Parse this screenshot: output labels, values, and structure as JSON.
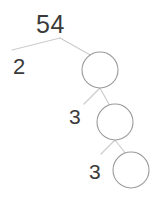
{
  "diagram": {
    "type": "factor-tree",
    "title_value": "54",
    "stroke_color": "#cccccc",
    "circle_stroke_color": "#9a9a9a",
    "text_color": "#3a3a3a",
    "background_color": "#ffffff",
    "labels": {
      "root": "54",
      "factor_2": "2",
      "factor_3a": "3",
      "factor_3b": "3"
    },
    "circles": [
      {
        "name": "circle-level-1",
        "cx": 100,
        "cy": 70,
        "r": 18,
        "value": ""
      },
      {
        "name": "circle-level-2",
        "cx": 115,
        "cy": 122,
        "r": 18,
        "value": ""
      },
      {
        "name": "circle-level-3",
        "cx": 131,
        "cy": 170,
        "r": 18,
        "value": ""
      }
    ],
    "branches": [
      {
        "name": "branch-root-left",
        "x1": 60,
        "y1": 38,
        "x2": 12,
        "y2": 50
      },
      {
        "name": "branch-root-right",
        "x1": 60,
        "y1": 38,
        "x2": 92,
        "y2": 56
      },
      {
        "name": "branch-level1-left",
        "x1": 100,
        "y1": 88,
        "x2": 84,
        "y2": 104
      },
      {
        "name": "branch-level1-right",
        "x1": 100,
        "y1": 88,
        "x2": 110,
        "y2": 106
      },
      {
        "name": "branch-level2-left",
        "x1": 115,
        "y1": 140,
        "x2": 101,
        "y2": 154
      },
      {
        "name": "branch-level2-right",
        "x1": 115,
        "y1": 140,
        "x2": 126,
        "y2": 154
      }
    ]
  }
}
